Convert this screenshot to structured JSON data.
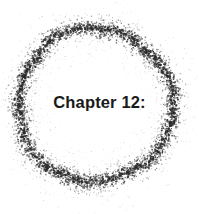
{
  "page": {
    "width": 199,
    "height": 214,
    "background_color": "#ffffff"
  },
  "title_block": {
    "text": "Chapter 12:",
    "color": "#1a1a1a",
    "font_weight": "bold",
    "align": "center"
  },
  "ornament": {
    "name": "stippled-ring",
    "shape": "circle",
    "style": "grunge-speckle-spray",
    "ink_color": "#2b2b2b",
    "center_x": 95,
    "center_y": 105,
    "core_radius": 77,
    "core_band_width": 8,
    "spray_spread": 13,
    "speck_count": 5200
  }
}
